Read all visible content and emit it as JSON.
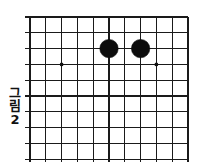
{
  "figure": {
    "caption_chars": [
      "그",
      "림",
      "2"
    ],
    "caption_full": "그림 2",
    "caption_orientation": "vertical"
  },
  "board": {
    "kind": "go-board-diagram",
    "description": "Cropped go (baduk) board showing the upper-right corner region",
    "columns": 11,
    "rows": 10,
    "cell_size": 15.8,
    "origin_x": 30,
    "origin_y": 17,
    "line_color": "#1a1a1a",
    "edge_color": "#1a1a1a",
    "background_color": "#ffffff",
    "edges": {
      "top": true,
      "right": true,
      "bottom": false,
      "left": false
    },
    "star_points": [
      {
        "col": 2,
        "row": 3
      },
      {
        "col": 8,
        "row": 3
      }
    ],
    "stones": [
      {
        "col": 5,
        "row": 2,
        "color": "black",
        "radius": 9.2
      },
      {
        "col": 7,
        "row": 2,
        "color": "black",
        "radius": 9.2
      }
    ],
    "stone_colors": {
      "black": "#0d0d0d"
    },
    "star_point_radius": 1.9,
    "overhang": 5
  }
}
